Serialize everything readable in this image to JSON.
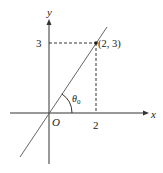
{
  "diagram": {
    "axis_labels": {
      "x": "x",
      "y": "y",
      "origin": "O"
    },
    "ticks": {
      "x_tick": "2",
      "y_tick": "3"
    },
    "point": {
      "label": "(2, 3)",
      "x": 2,
      "y": 3
    },
    "angle": {
      "label": "θ",
      "subscript": "0"
    },
    "colors": {
      "axes": "#333333",
      "line": "#555555",
      "dashed": "#333333",
      "text": "#222222"
    }
  }
}
